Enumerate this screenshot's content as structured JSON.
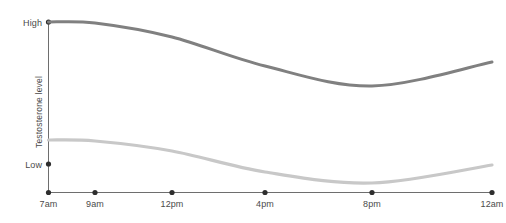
{
  "chart_data": {
    "type": "line",
    "title": "",
    "xlabel": "",
    "ylabel": "Testosterone level",
    "grid": false,
    "legend": "none",
    "x": [
      "7am",
      "9am",
      "12pm",
      "4pm",
      "8pm",
      "12am"
    ],
    "categories": [
      "7am",
      "9am",
      "12pm",
      "4pm",
      "8pm",
      "12am"
    ],
    "xtick_labels": {
      "t0": "7am",
      "t1": "9am",
      "t2": "12pm",
      "t3": "4pm",
      "t4": "8pm",
      "t5": "12am"
    },
    "ytick_labels": {
      "high": "High",
      "low": "Low"
    },
    "ylim_labels": [
      "Low",
      "High"
    ],
    "series": [
      {
        "name": "upper-curve",
        "color": "#808080",
        "stroke_width": 3,
        "values_normalized": [
          1.0,
          0.99,
          0.79,
          0.4,
          0.22,
          0.36
        ],
        "values_pixels_y": [
          22,
          23,
          37,
          66,
          86,
          62
        ]
      },
      {
        "name": "lower-curve",
        "color": "#c8c8c8",
        "stroke_width": 3.2,
        "values_normalized": [
          0.31,
          0.3,
          0.22,
          0.09,
          0.05,
          0.16
        ],
        "values_pixels_y": [
          140,
          141,
          151,
          172,
          183,
          165
        ]
      }
    ],
    "axis_color": "#6e6e6e",
    "tick_dot_color": "#2e2e2e",
    "label_color": "#4a4a4a"
  },
  "axes": {
    "y_axis_title": "Testosterone level",
    "y_high_label": "High",
    "y_low_label": "Low",
    "x_labels": [
      "7am",
      "9am",
      "12pm",
      "4pm",
      "8pm",
      "12am"
    ]
  }
}
